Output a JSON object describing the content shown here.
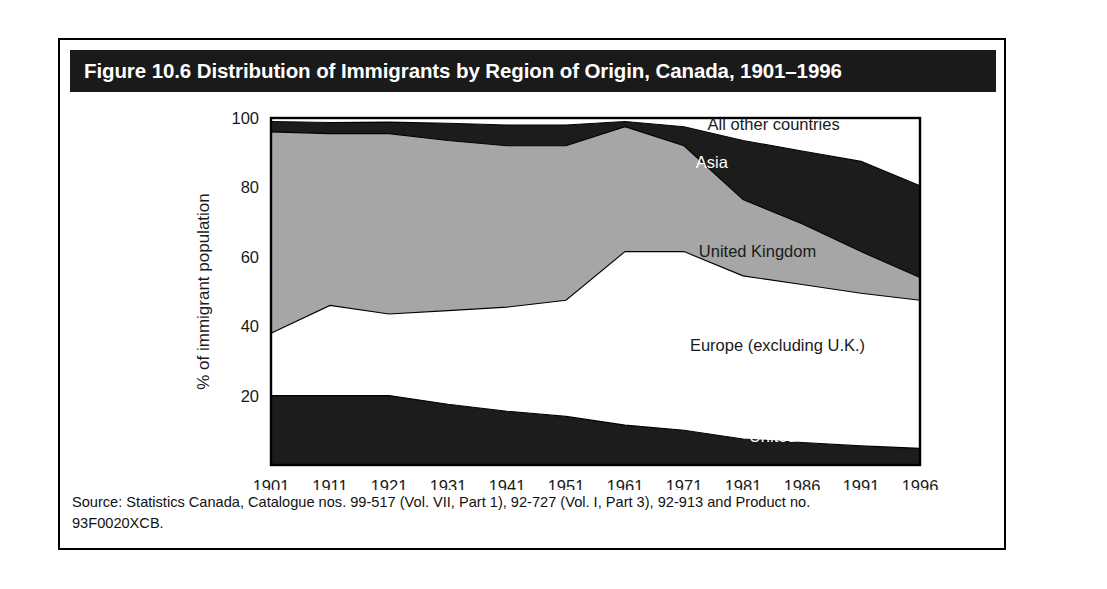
{
  "figure": {
    "title": "Figure 10.6 Distribution of Immigrants by Region of Origin, Canada, 1901–1996",
    "source_line_1": "Source: Statistics Canada, Catalogue nos. 99-517 (Vol. VII, Part 1), 92-727 (Vol. I, Part 3), 92-913 and Product no.",
    "source_line_2": "93F0020XCB."
  },
  "colors": {
    "title_bar": "#1a1a1a",
    "frame_border": "#000000",
    "dark_band": "#1c1c1c",
    "gray_band": "#a6a6a6",
    "white_band": "#ffffff",
    "text": "#1a1a1a"
  },
  "chart_data": {
    "type": "area",
    "title": "Distribution of Immigrants by Region of Origin, Canada, 1901–1996",
    "xlabel": "",
    "ylabel": "% of immigrant population",
    "ylim": [
      0,
      100
    ],
    "yticks": [
      20,
      40,
      60,
      80,
      100
    ],
    "grid": false,
    "legend_position": "inline-labels",
    "stacked": true,
    "stack_order_bottom_to_top": [
      "United States",
      "Europe (excluding U.K.)",
      "United Kingdom",
      "Asia",
      "All other countries"
    ],
    "categories": [
      "1901",
      "1911",
      "1921",
      "1931",
      "1941",
      "1951",
      "1961",
      "1971",
      "1981",
      "1986",
      "1991",
      "1996"
    ],
    "series": [
      {
        "name": "United States",
        "fill": "#1c1c1c",
        "label_color": "#ffffff",
        "values": [
          20.0,
          20.0,
          20.0,
          17.5,
          15.5,
          14.0,
          11.5,
          10.0,
          7.5,
          6.5,
          5.5,
          4.8
        ]
      },
      {
        "name": "Europe (excluding U.K.)",
        "fill": "#ffffff",
        "label_color": "#1a1a1a",
        "values": [
          18.0,
          26.0,
          23.5,
          27.0,
          30.0,
          33.5,
          50.0,
          51.5,
          47.0,
          45.5,
          44.0,
          42.7
        ]
      },
      {
        "name": "United Kingdom",
        "fill": "#a6a6a6",
        "label_color": "#1a1a1a",
        "values": [
          58.0,
          49.5,
          52.0,
          49.0,
          46.5,
          44.5,
          36.0,
          30.5,
          22.0,
          17.5,
          12.0,
          6.5
        ]
      },
      {
        "name": "Asia",
        "fill": "#1c1c1c",
        "label_color": "#ffffff",
        "values": [
          3.0,
          3.2,
          3.3,
          5.0,
          6.0,
          6.0,
          1.5,
          5.5,
          17.0,
          21.0,
          26.0,
          26.5
        ]
      },
      {
        "name": "All other countries",
        "fill": "#ffffff",
        "label_color": "#1a1a1a",
        "values": [
          1.0,
          1.3,
          1.2,
          1.5,
          2.0,
          2.0,
          1.0,
          2.5,
          6.5,
          9.5,
          12.5,
          19.5
        ]
      }
    ],
    "cumulative_tops": {
      "United States": [
        20.0,
        20.0,
        20.0,
        17.5,
        15.5,
        14.0,
        11.5,
        10.0,
        7.5,
        6.5,
        5.5,
        4.8
      ],
      "Europe (excluding U.K.)": [
        38.0,
        46.0,
        43.5,
        44.5,
        45.5,
        47.5,
        61.5,
        61.5,
        54.5,
        52.0,
        49.5,
        47.5
      ],
      "United Kingdom": [
        96.0,
        95.5,
        95.5,
        93.5,
        92.0,
        92.0,
        97.5,
        92.0,
        76.5,
        69.5,
        61.5,
        54.0
      ],
      "Asia": [
        99.0,
        98.7,
        98.8,
        98.5,
        98.0,
        98.0,
        99.0,
        97.5,
        93.5,
        90.5,
        87.5,
        80.5
      ],
      "All other countries": [
        100,
        100,
        100,
        100,
        100,
        100,
        100,
        100,
        100,
        100,
        100,
        100
      ]
    },
    "series_label_positions": [
      {
        "name": "All other countries",
        "x_value": 1975.0,
        "y_value": 96.5,
        "anchor": "start",
        "color": "#1a1a1a"
      },
      {
        "name": "Asia",
        "x_value": 1973.0,
        "y_value": 85.5,
        "anchor": "start",
        "color": "#ffffff"
      },
      {
        "name": "United Kingdom",
        "x_value": 1973.5,
        "y_value": 60.0,
        "anchor": "start",
        "color": "#1a1a1a"
      },
      {
        "name": "Europe (excluding U.K.)",
        "x_value": 1972.0,
        "y_value": 33.0,
        "anchor": "start",
        "color": "#1a1a1a"
      },
      {
        "name": "United States",
        "x_value": 1981.5,
        "y_value": 6.5,
        "anchor": "start",
        "color": "#ffffff"
      }
    ]
  }
}
